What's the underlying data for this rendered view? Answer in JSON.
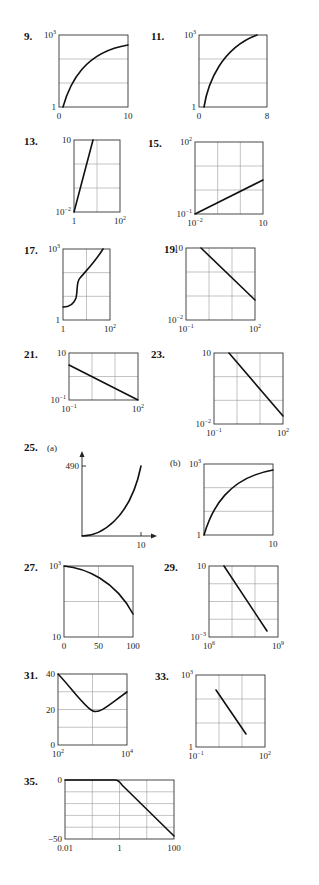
{
  "page": {
    "background": "#ffffff",
    "curve_color": "#111111",
    "grid_color": "#9a9a9a"
  },
  "chart_data": [
    {
      "id": "9",
      "label": "9.",
      "type": "line",
      "yscale": "log",
      "frame": [
        59,
        35,
        128,
        107
      ],
      "vgrid": 1,
      "hgrid": 3,
      "y_ticks": [
        {
          "text": "10",
          "sup": "3",
          "pos": "top"
        },
        {
          "text": "1",
          "pos": "bottom"
        }
      ],
      "x_ticks": [
        {
          "text": "0",
          "pos": "left"
        },
        {
          "text": "10",
          "pos": "right"
        }
      ],
      "xlim": [
        0,
        10
      ],
      "ylim": [
        1,
        1000
      ],
      "points": [
        [
          0.9,
          0
        ],
        [
          0.15,
          0.08
        ],
        [
          0.25,
          0.3
        ],
        [
          0.4,
          0.55
        ],
        [
          0.55,
          0.72
        ],
        [
          0.7,
          0.83
        ],
        [
          0.85,
          0.9
        ],
        [
          1.0,
          0.93
        ]
      ],
      "pathspec": "M63,107 C70,82 85,52 128,45"
    },
    {
      "id": "11",
      "label": "11.",
      "type": "line",
      "yscale": "log",
      "frame": [
        199,
        35,
        267,
        107
      ],
      "vgrid": 1,
      "hgrid": 3,
      "y_ticks": [
        {
          "text": "10",
          "sup": "3",
          "pos": "top"
        },
        {
          "text": "1",
          "pos": "bottom"
        }
      ],
      "x_ticks": [
        {
          "text": "0",
          "pos": "left"
        },
        {
          "text": "8",
          "pos": "right"
        }
      ],
      "xlim": [
        0,
        8
      ],
      "ylim": [
        1,
        1000
      ],
      "pathspec": "M204,107 C208,82 222,48 257,35"
    },
    {
      "id": "13",
      "label": "13.",
      "type": "line",
      "xscale": "log",
      "yscale": "log",
      "frame": [
        74,
        140,
        120,
        212
      ],
      "vgrid": 2,
      "hgrid": 3,
      "y_ticks": [
        {
          "text": "10",
          "pos": "top"
        },
        {
          "text": "10",
          "sup": "−2",
          "pos": "bottom"
        }
      ],
      "x_ticks": [
        {
          "text": "1",
          "pos": "left"
        },
        {
          "text": "10",
          "sup": "2",
          "pos": "right"
        }
      ],
      "xlim": [
        1,
        100
      ],
      "ylim": [
        0.01,
        10
      ],
      "pathspec": "M74,212 L93,140"
    },
    {
      "id": "15",
      "label": "15.",
      "type": "line",
      "xscale": "log",
      "yscale": "log",
      "frame": [
        195,
        142,
        263,
        214
      ],
      "vgrid": 3,
      "hgrid": 3,
      "y_ticks": [
        {
          "text": "10",
          "sup": "2",
          "pos": "top"
        },
        {
          "text": "10",
          "sup": "−1",
          "pos": "bottom"
        }
      ],
      "x_ticks": [
        {
          "text": "10",
          "sup": "−2",
          "pos": "left"
        },
        {
          "text": "10",
          "pos": "right"
        }
      ],
      "xlim": [
        0.01,
        10
      ],
      "ylim": [
        0.1,
        100
      ],
      "pathspec": "M195,214 L263,180"
    },
    {
      "id": "17",
      "label": "17.",
      "type": "line",
      "xscale": "log",
      "yscale": "log",
      "frame": [
        63,
        249,
        110,
        320
      ],
      "vgrid": 2,
      "hgrid": 3,
      "y_ticks": [
        {
          "text": "10",
          "sup": "3",
          "pos": "top"
        },
        {
          "text": "1",
          "pos": "bottom"
        }
      ],
      "x_ticks": [
        {
          "text": "1",
          "pos": "left"
        },
        {
          "text": "10",
          "sup": "2",
          "pos": "right"
        }
      ],
      "xlim": [
        1,
        100
      ],
      "ylim": [
        1,
        1000
      ],
      "pathspec": "M63,307 C70,307 74,304 76,298 C78,290 76,282 80,278 C85,272 95,262 103,249"
    },
    {
      "id": "19",
      "label": "19.",
      "type": "line",
      "xscale": "log",
      "yscale": "log",
      "frame": [
        186,
        248,
        255,
        320
      ],
      "vgrid": 3,
      "hgrid": 3,
      "y_ticks": [
        {
          "text": "10",
          "pos": "top"
        },
        {
          "text": "10",
          "sup": "−2",
          "pos": "bottom"
        }
      ],
      "x_ticks": [
        {
          "text": "10",
          "sup": "−1",
          "pos": "left"
        },
        {
          "text": "10",
          "sup": "2",
          "pos": "right"
        }
      ],
      "xlim": [
        0.1,
        100
      ],
      "ylim": [
        0.01,
        10
      ],
      "pathspec": "M201,248 L255,300"
    },
    {
      "id": "21",
      "label": "21.",
      "type": "line",
      "xscale": "log",
      "yscale": "log",
      "frame": [
        69,
        353,
        138,
        400
      ],
      "vgrid": 3,
      "hgrid": 2,
      "y_ticks": [
        {
          "text": "10",
          "pos": "top"
        },
        {
          "text": "10",
          "sup": "−1",
          "pos": "bottom"
        }
      ],
      "x_ticks": [
        {
          "text": "10",
          "sup": "−1",
          "pos": "left"
        },
        {
          "text": "10",
          "sup": "2",
          "pos": "right"
        }
      ],
      "xlim": [
        0.1,
        100
      ],
      "ylim": [
        0.1,
        10
      ],
      "pathspec": "M69,365 L138,400"
    },
    {
      "id": "23",
      "label": "23.",
      "type": "line",
      "xscale": "log",
      "yscale": "log",
      "frame": [
        214,
        353,
        283,
        424
      ],
      "vgrid": 3,
      "hgrid": 3,
      "y_ticks": [
        {
          "text": "10",
          "pos": "top"
        },
        {
          "text": "10",
          "sup": "−2",
          "pos": "bottom"
        }
      ],
      "x_ticks": [
        {
          "text": "10",
          "sup": "−1",
          "pos": "left"
        },
        {
          "text": "10",
          "sup": "2",
          "pos": "right"
        }
      ],
      "xlim": [
        0.1,
        100
      ],
      "ylim": [
        0.01,
        10
      ],
      "pathspec": "M229,353 L283,416"
    },
    {
      "id": "25a",
      "label": "25.",
      "sublabel": "(a)",
      "type": "line",
      "axes_only": true,
      "origin": [
        82,
        536
      ],
      "x_end": 153,
      "y_top": 455,
      "y_ticks": [
        {
          "text": "490",
          "y": 466
        }
      ],
      "x_ticks": [
        {
          "text": "10",
          "x": 141
        }
      ],
      "xlim": [
        0,
        10
      ],
      "ylim": [
        0,
        490
      ],
      "pathspec": "M82,536 C100,536 130,520 141,466"
    },
    {
      "id": "25b",
      "label": "",
      "sublabel": "(b)",
      "type": "line",
      "yscale": "log",
      "frame": [
        204,
        464,
        273,
        535
      ],
      "vgrid": 1,
      "hgrid": 3,
      "y_ticks": [
        {
          "text": "10",
          "sup": "3",
          "pos": "top"
        },
        {
          "text": "1",
          "pos": "bottom"
        }
      ],
      "x_ticks": [
        {
          "text": "10",
          "pos": "right"
        }
      ],
      "xlim": [
        0,
        10
      ],
      "ylim": [
        1,
        1000
      ],
      "pathspec": "M204,535 C212,508 228,478 273,470"
    },
    {
      "id": "27",
      "label": "27.",
      "type": "line",
      "yscale": "log",
      "frame": [
        64,
        566,
        133,
        637
      ],
      "vgrid": 2,
      "hgrid": 2,
      "y_ticks": [
        {
          "text": "10",
          "sup": "3",
          "pos": "top"
        },
        {
          "text": "10",
          "pos": "bottom"
        }
      ],
      "x_ticks": [
        {
          "text": "0",
          "pos": "left"
        },
        {
          "text": "50",
          "pos": "mid"
        },
        {
          "text": "100",
          "pos": "right"
        }
      ],
      "xlim": [
        0,
        100
      ],
      "ylim": [
        10,
        1000
      ],
      "pathspec": "M64,566 C85,568 115,580 133,614"
    },
    {
      "id": "29",
      "label": "29.",
      "type": "line",
      "xscale": "log",
      "yscale": "log",
      "frame": [
        209,
        566,
        278,
        637
      ],
      "vgrid": 3,
      "hgrid": 4,
      "y_ticks": [
        {
          "text": "10",
          "pos": "top"
        },
        {
          "text": "10",
          "sup": "−3",
          "pos": "bottom"
        }
      ],
      "x_ticks": [
        {
          "text": "10",
          "sup": "6",
          "pos": "left"
        },
        {
          "text": "10",
          "sup": "9",
          "pos": "right"
        }
      ],
      "xlim": [
        1000000,
        1000000000
      ],
      "ylim": [
        0.001,
        10
      ],
      "pathspec": "M224,566 L267,631"
    },
    {
      "id": "31",
      "label": "31.",
      "type": "line",
      "xscale": "log",
      "frame": [
        58,
        674,
        127,
        745
      ],
      "vgrid": 2,
      "hgrid": 4,
      "y_ticks": [
        {
          "text": "40",
          "pos": "top"
        },
        {
          "text": "20",
          "pos": "mid"
        },
        {
          "text": "0",
          "pos": "bottom"
        }
      ],
      "x_ticks": [
        {
          "text": "10",
          "sup": "2",
          "pos": "left"
        },
        {
          "text": "10",
          "sup": "4",
          "pos": "right"
        }
      ],
      "xlim": [
        100,
        10000
      ],
      "ylim": [
        0,
        40
      ],
      "pathspec": "M58,674 C70,686 85,708 93,711 C100,714 110,704 127,692"
    },
    {
      "id": "33",
      "label": "33.",
      "type": "line",
      "xscale": "log",
      "yscale": "log",
      "frame": [
        196,
        675,
        265,
        747
      ],
      "vgrid": 3,
      "hgrid": 3,
      "y_ticks": [
        {
          "text": "10",
          "sup": "3",
          "pos": "top"
        },
        {
          "text": "1",
          "pos": "bottom"
        }
      ],
      "x_ticks": [
        {
          "text": "10",
          "sup": "−1",
          "pos": "left"
        },
        {
          "text": "10",
          "sup": "2",
          "pos": "right"
        }
      ],
      "xlim": [
        0.1,
        100
      ],
      "ylim": [
        1,
        1000
      ],
      "pathspec": "M216,690 L246,734"
    },
    {
      "id": "35",
      "label": "35.",
      "type": "line",
      "xscale": "log",
      "frame": [
        65,
        780,
        174,
        839
      ],
      "vgrid": 4,
      "hgrid": 5,
      "y_ticks": [
        {
          "text": "0",
          "pos": "top"
        },
        {
          "text": "−50",
          "pos": "bottom"
        }
      ],
      "x_ticks": [
        {
          "text": "0.01",
          "pos": "left"
        },
        {
          "text": "1",
          "pos": "mid"
        },
        {
          "text": "100",
          "pos": "right"
        }
      ],
      "xlim": [
        0.01,
        100
      ],
      "ylim": [
        -50,
        0
      ],
      "pathspec": "M65,780 L115,780 C118,780 120,782 122,785 L174,836"
    }
  ],
  "labels": {
    "l9": "9.",
    "l11": "11.",
    "l13": "13.",
    "l15": "15.",
    "l17": "17.",
    "l19": "19.",
    "l21": "21.",
    "l23": "23.",
    "l25": "25.",
    "l27": "27.",
    "l29": "29.",
    "l31": "31.",
    "l33": "33.",
    "l35": "35.",
    "sub_a": "(a)",
    "sub_b": "(b)"
  }
}
